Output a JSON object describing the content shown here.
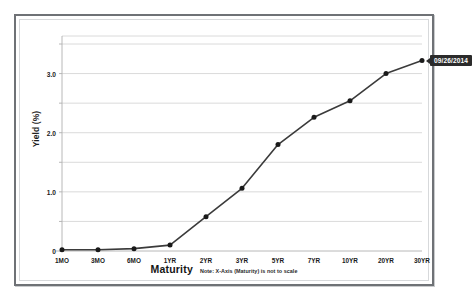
{
  "chart_data": {
    "type": "line",
    "title": "",
    "xlabel": "Maturity",
    "ylabel": "Yield (%)",
    "categories": [
      "1MO",
      "3MO",
      "6MO",
      "1YR",
      "2YR",
      "3YR",
      "5YR",
      "7YR",
      "10YR",
      "20YR",
      "30YR"
    ],
    "series": [
      {
        "name": "09/26/2014",
        "values": [
          0.02,
          0.02,
          0.04,
          0.1,
          0.58,
          1.06,
          1.8,
          2.26,
          2.54,
          3.0,
          3.22
        ]
      }
    ],
    "ylim": [
      0,
      3.5
    ],
    "y_ticks": [
      0,
      0.5,
      1.0,
      1.5,
      2.0,
      2.5,
      3.0,
      3.5
    ],
    "y_tick_labels": [
      "0",
      "",
      "1.0",
      "",
      "2.0",
      "",
      "3.0",
      ""
    ],
    "grid": true,
    "legend_position": "none",
    "note": "Note: X-Axis (Maturity) is not to scale",
    "series_color": "#3b3b3b",
    "marker_color": "#1a1a1a",
    "grid_color": "#d0d0d0",
    "axis_color": "#b0b0b0",
    "callout_background": "#2b2b2b",
    "callout_text_color": "#ffffff"
  },
  "frame": {
    "border_color": "#6f7276",
    "inner_border_color": "#d7d9db",
    "background": "#ffffff"
  }
}
